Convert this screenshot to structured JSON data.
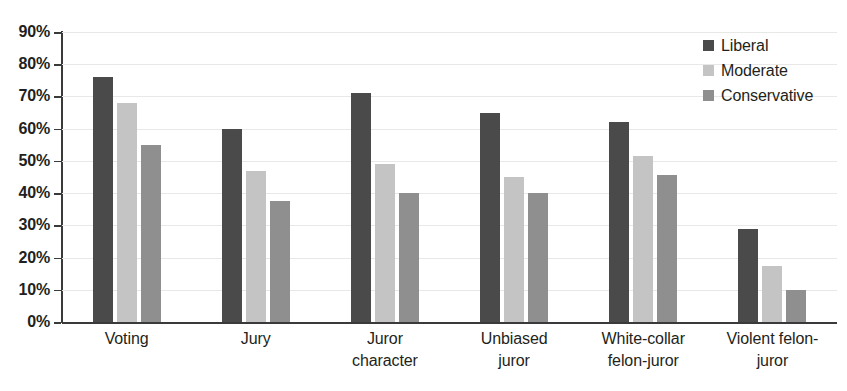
{
  "chart_data": {
    "type": "bar",
    "title": "",
    "subtitle": "",
    "xlabel": "",
    "ylabel": "",
    "ylim": [
      0,
      90
    ],
    "y_tick_labels": [
      "0%",
      "10%",
      "20%",
      "30%",
      "40%",
      "50%",
      "60%",
      "70%",
      "80%",
      "90%"
    ],
    "y_ticks": [
      0,
      10,
      20,
      30,
      40,
      50,
      60,
      70,
      80,
      90
    ],
    "grid": true,
    "grid_axis": "y",
    "legend_position": "top-right",
    "categories": [
      "Voting",
      "Jury",
      "Juror character",
      "Unbiased juror",
      "White-collar felon-juror",
      "Violent felon-juror"
    ],
    "category_lines": [
      [
        "Voting"
      ],
      [
        "Jury"
      ],
      [
        "Juror",
        "character"
      ],
      [
        "Unbiased",
        "juror"
      ],
      [
        "White-collar",
        "felon-juror"
      ],
      [
        "Violent felon-",
        "juror"
      ]
    ],
    "series": [
      {
        "name": "Liberal",
        "color": "#4a4a4a",
        "values": [
          76,
          60,
          71,
          65,
          62,
          29
        ]
      },
      {
        "name": "Moderate",
        "color": "#c4c4c4",
        "values": [
          68,
          47,
          49,
          45,
          51.5,
          17.5
        ]
      },
      {
        "name": "Conservative",
        "color": "#8f8f8f",
        "values": [
          55,
          37.5,
          40,
          40,
          45.5,
          10
        ]
      }
    ]
  },
  "legend": {
    "items": [
      {
        "label": "Liberal",
        "color": "#4a4a4a"
      },
      {
        "label": "Moderate",
        "color": "#c4c4c4"
      },
      {
        "label": "Conservative",
        "color": "#8f8f8f"
      }
    ]
  },
  "colors": {
    "liberal": "#4a4a4a",
    "moderate": "#c4c4c4",
    "conservative": "#8f8f8f",
    "axis": "#3a3a3a",
    "gridline": "#e8e8e6",
    "text": "#231f20",
    "background": "#ffffff"
  }
}
